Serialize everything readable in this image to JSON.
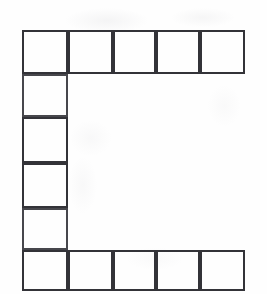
{
  "figure": {
    "shape": "u-shape",
    "ink_color": "#3b3b3f",
    "paper_color": "#fefefe",
    "stroke_width_px": 2,
    "total_cells": 13,
    "geometry": {
      "outer_left_px": 22,
      "outer_top_px": 30,
      "outer_right_px": 245,
      "outer_bottom_px": 291,
      "column_edges_px": [
        22,
        68,
        113,
        156,
        200,
        245
      ],
      "row_edges_px": [
        30,
        74,
        117,
        163,
        208,
        250,
        291
      ],
      "column_count": 5,
      "row_count": 6,
      "cell_width_px": 45,
      "cell_height_px": 44,
      "interior_opening": {
        "left_px": 68,
        "top_px": 74,
        "right_px": 245,
        "bottom_px": 250,
        "filled": false
      }
    },
    "cells": [
      {
        "id": "r1c1",
        "row": 1,
        "col": 1,
        "x": 22,
        "y": 30,
        "w": 46,
        "h": 44,
        "group": "top-row",
        "ink": "ink-dark"
      },
      {
        "id": "r1c2",
        "row": 1,
        "col": 2,
        "x": 68,
        "y": 30,
        "w": 45,
        "h": 44,
        "group": "top-row",
        "ink": "ink-dark"
      },
      {
        "id": "r1c3",
        "row": 1,
        "col": 3,
        "x": 113,
        "y": 30,
        "w": 43,
        "h": 44,
        "group": "top-row",
        "ink": "ink-dark"
      },
      {
        "id": "r1c4",
        "row": 1,
        "col": 4,
        "x": 156,
        "y": 30,
        "w": 44,
        "h": 44,
        "group": "top-row",
        "ink": "ink-dark"
      },
      {
        "id": "r1c5",
        "row": 1,
        "col": 5,
        "x": 200,
        "y": 30,
        "w": 45,
        "h": 44,
        "group": "top-row",
        "ink": "ink-dark"
      },
      {
        "id": "r2c1",
        "row": 2,
        "col": 1,
        "x": 22,
        "y": 74,
        "w": 46,
        "h": 43,
        "group": "left-column",
        "ink": "ink-soft"
      },
      {
        "id": "r3c1",
        "row": 3,
        "col": 1,
        "x": 22,
        "y": 117,
        "w": 46,
        "h": 46,
        "group": "left-column",
        "ink": "ink-dark"
      },
      {
        "id": "r4c1",
        "row": 4,
        "col": 1,
        "x": 22,
        "y": 163,
        "w": 46,
        "h": 45,
        "group": "left-column",
        "ink": "ink-dark"
      },
      {
        "id": "r5c1",
        "row": 5,
        "col": 1,
        "x": 22,
        "y": 208,
        "w": 46,
        "h": 42,
        "group": "left-column",
        "ink": "ink-soft"
      },
      {
        "id": "r6c1",
        "row": 6,
        "col": 1,
        "x": 22,
        "y": 250,
        "w": 46,
        "h": 41,
        "group": "bottom-row",
        "ink": "ink-dark"
      },
      {
        "id": "r6c2",
        "row": 6,
        "col": 2,
        "x": 68,
        "y": 250,
        "w": 45,
        "h": 41,
        "group": "bottom-row",
        "ink": "ink-dark"
      },
      {
        "id": "r6c3",
        "row": 6,
        "col": 3,
        "x": 113,
        "y": 250,
        "w": 43,
        "h": 41,
        "group": "bottom-row",
        "ink": "ink-dark"
      },
      {
        "id": "r6c4",
        "row": 6,
        "col": 4,
        "x": 156,
        "y": 250,
        "w": 44,
        "h": 41,
        "group": "bottom-row",
        "ink": "ink-dark"
      },
      {
        "id": "r6c5",
        "row": 6,
        "col": 5,
        "x": 200,
        "y": 250,
        "w": 45,
        "h": 41,
        "group": "bottom-row",
        "ink": "ink-dark"
      }
    ]
  }
}
